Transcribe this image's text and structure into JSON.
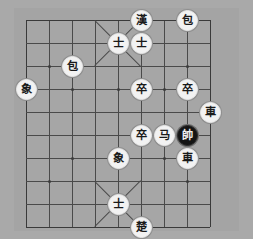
{
  "app": {
    "title": "Xiangqi Board",
    "background_color": "#a9a9a9",
    "board_color": "#a6a6a6",
    "line_color": "#4a4a4a"
  },
  "board": {
    "files": 9,
    "ranks": 10,
    "cell_size": 23,
    "origin_x": 26,
    "origin_y": 20,
    "star_points": [
      {
        "file": 1,
        "rank": 2
      },
      {
        "file": 7,
        "rank": 2
      },
      {
        "file": 1,
        "rank": 7
      },
      {
        "file": 7,
        "rank": 7
      },
      {
        "file": 2,
        "rank": 3
      },
      {
        "file": 4,
        "rank": 3
      },
      {
        "file": 6,
        "rank": 3
      },
      {
        "file": 2,
        "rank": 6
      },
      {
        "file": 4,
        "rank": 6
      },
      {
        "file": 6,
        "rank": 6
      }
    ],
    "palaces": [
      {
        "side": "top",
        "file_from": 3,
        "file_to": 5,
        "rank_from": 0,
        "rank_to": 2
      },
      {
        "side": "bottom",
        "file_from": 3,
        "file_to": 5,
        "rank_from": 7,
        "rank_to": 9
      }
    ]
  },
  "pieces": [
    {
      "id": "p1",
      "name": "general-han",
      "glyph": "漢",
      "color": "red",
      "file": 5,
      "rank": 0
    },
    {
      "id": "p2",
      "name": "cannon-top-right",
      "glyph": "包",
      "color": "red",
      "file": 7,
      "rank": 0
    },
    {
      "id": "p3",
      "name": "advisor-top-left",
      "glyph": "士",
      "color": "red",
      "file": 4,
      "rank": 1
    },
    {
      "id": "p4",
      "name": "advisor-top-right",
      "glyph": "士",
      "color": "red",
      "file": 5,
      "rank": 1
    },
    {
      "id": "p5",
      "name": "cannon-upper-left",
      "glyph": "包",
      "color": "red",
      "file": 2,
      "rank": 2
    },
    {
      "id": "p6",
      "name": "elephant-left",
      "glyph": "象",
      "color": "red",
      "file": 0,
      "rank": 3
    },
    {
      "id": "p7",
      "name": "pawn-center",
      "glyph": "卒",
      "color": "red",
      "file": 5,
      "rank": 3
    },
    {
      "id": "p8",
      "name": "pawn-right",
      "glyph": "卒",
      "color": "red",
      "file": 7,
      "rank": 3
    },
    {
      "id": "p9",
      "name": "chariot-right-edge",
      "glyph": "車",
      "color": "red",
      "file": 8,
      "rank": 4
    },
    {
      "id": "p10",
      "name": "pawn-lower",
      "glyph": "卒",
      "color": "red",
      "file": 5,
      "rank": 5
    },
    {
      "id": "p11",
      "name": "horse-center",
      "glyph": "马",
      "color": "red",
      "file": 6,
      "rank": 5
    },
    {
      "id": "p12",
      "name": "general-black",
      "glyph": "帥",
      "color": "black",
      "file": 7,
      "rank": 5
    },
    {
      "id": "p13",
      "name": "chariot-lower",
      "glyph": "車",
      "color": "red",
      "file": 7,
      "rank": 6
    },
    {
      "id": "p14",
      "name": "elephant-lower",
      "glyph": "象",
      "color": "red",
      "file": 4,
      "rank": 6
    },
    {
      "id": "p15",
      "name": "advisor-bottom",
      "glyph": "士",
      "color": "red",
      "file": 4,
      "rank": 8
    },
    {
      "id": "p16",
      "name": "general-chu",
      "glyph": "楚",
      "color": "red",
      "file": 5,
      "rank": 9
    }
  ]
}
